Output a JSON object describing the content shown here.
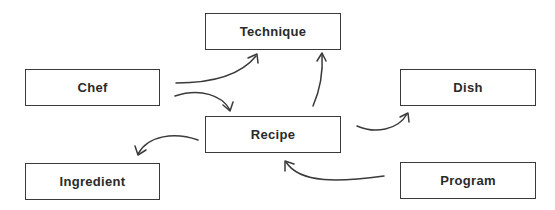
{
  "diagram": {
    "type": "concept-map",
    "nodes": [
      {
        "id": "technique",
        "label": "Technique"
      },
      {
        "id": "chef",
        "label": "Chef"
      },
      {
        "id": "dish",
        "label": "Dish"
      },
      {
        "id": "recipe",
        "label": "Recipe"
      },
      {
        "id": "ingredient",
        "label": "Ingredient"
      },
      {
        "id": "program",
        "label": "Program"
      }
    ],
    "edges": [
      {
        "from": "chef",
        "to": "technique"
      },
      {
        "from": "chef",
        "to": "recipe"
      },
      {
        "from": "recipe",
        "to": "technique"
      },
      {
        "from": "recipe",
        "to": "dish"
      },
      {
        "from": "recipe",
        "to": "ingredient"
      },
      {
        "from": "program",
        "to": "recipe"
      }
    ],
    "colors": {
      "stroke": "#3a3a3a",
      "text": "#2a2a2a",
      "background": "#ffffff"
    }
  }
}
